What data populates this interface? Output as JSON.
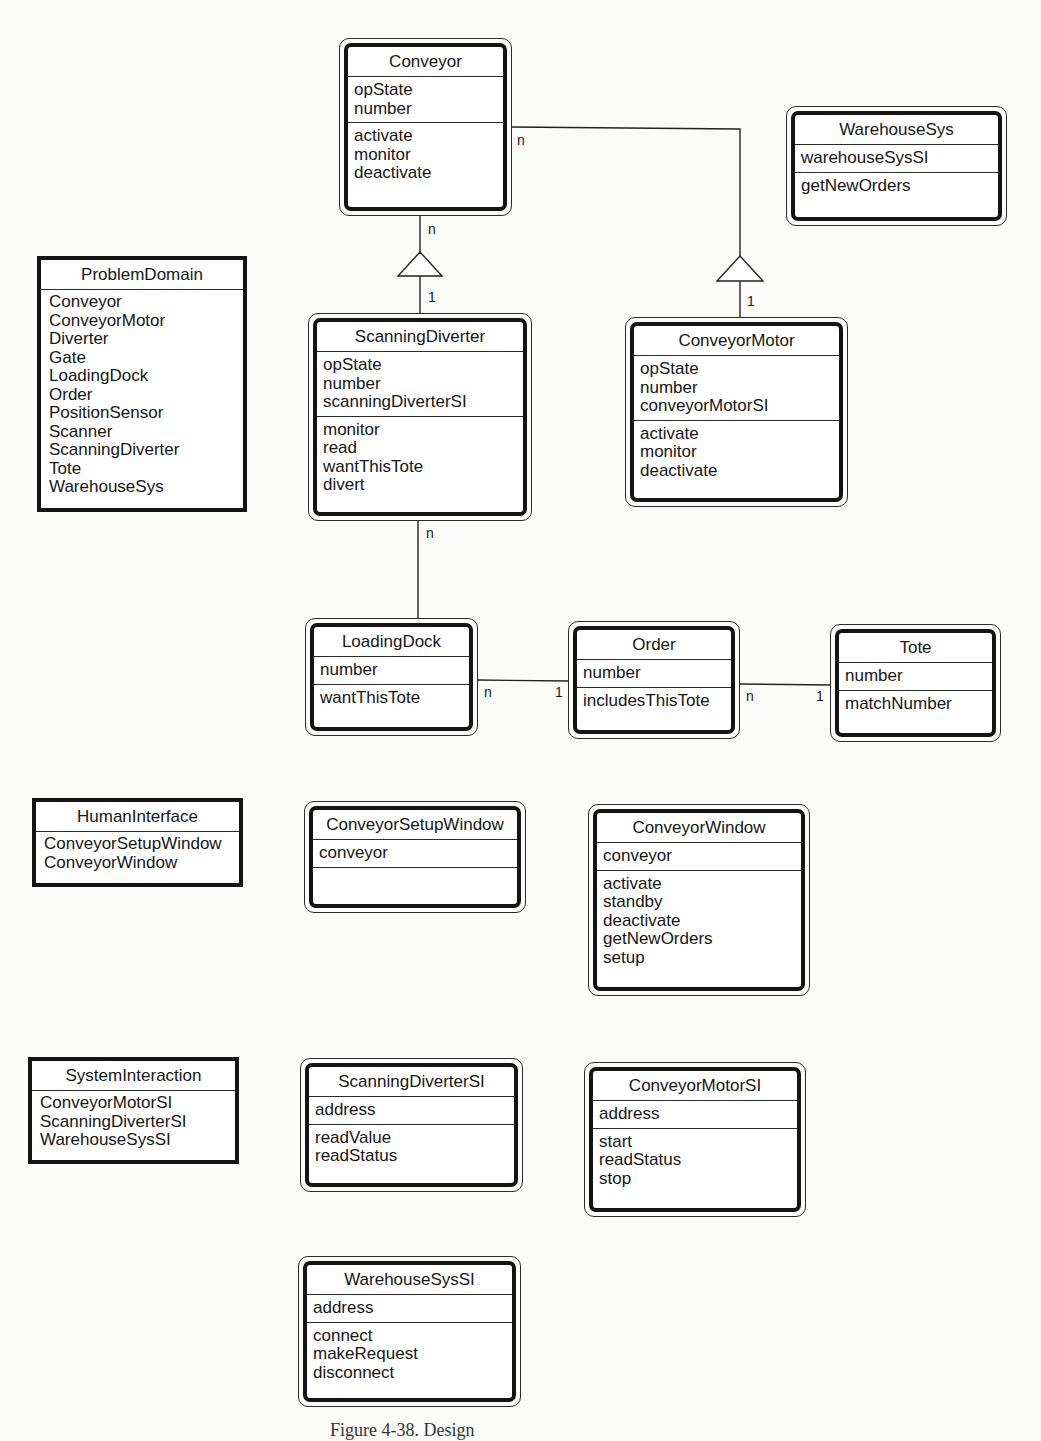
{
  "diagram": {
    "classes": {
      "conveyor": {
        "name": "Conveyor",
        "attributes": [
          "opState",
          "number"
        ],
        "services": [
          "activate",
          "monitor",
          "deactivate"
        ]
      },
      "warehouse_sys": {
        "name": "WarehouseSys",
        "attributes": [
          "warehouseSysSI"
        ],
        "services": [
          "getNewOrders"
        ]
      },
      "scanning_diverter": {
        "name": "ScanningDiverter",
        "attributes": [
          "opState",
          "number",
          "scanningDiverterSI"
        ],
        "services": [
          "monitor",
          "read",
          "wantThisTote",
          "divert"
        ]
      },
      "conveyor_motor": {
        "name": "ConveyorMotor",
        "attributes": [
          "opState",
          "number",
          "conveyorMotorSI"
        ],
        "services": [
          "activate",
          "monitor",
          "deactivate"
        ]
      },
      "loading_dock": {
        "name": "LoadingDock",
        "attributes": [
          "number"
        ],
        "services": [
          "wantThisTote"
        ]
      },
      "order": {
        "name": "Order",
        "attributes": [
          "number"
        ],
        "services": [
          "includesThisTote"
        ]
      },
      "tote": {
        "name": "Tote",
        "attributes": [
          "number"
        ],
        "services": [
          "matchNumber"
        ]
      },
      "conveyor_setup_window": {
        "name": "ConveyorSetupWindow",
        "attributes": [
          "conveyor"
        ],
        "services": []
      },
      "conveyor_window": {
        "name": "ConveyorWindow",
        "attributes": [
          "conveyor"
        ],
        "services": [
          "activate",
          "standby",
          "deactivate",
          "getNewOrders",
          "setup"
        ]
      },
      "scanning_diverter_si": {
        "name": "ScanningDiverterSI",
        "attributes": [
          "address"
        ],
        "services": [
          "readValue",
          "readStatus"
        ]
      },
      "conveyor_motor_si": {
        "name": "ConveyorMotorSI",
        "attributes": [
          "address"
        ],
        "services": [
          "start",
          "readStatus",
          "stop"
        ]
      },
      "warehouse_sys_si": {
        "name": "WarehouseSysSI",
        "attributes": [
          "address"
        ],
        "services": [
          "connect",
          "makeRequest",
          "disconnect"
        ]
      }
    },
    "subjects": {
      "problem_domain": {
        "name": "ProblemDomain",
        "items": [
          "Conveyor",
          "ConveyorMotor",
          "Diverter",
          "Gate",
          "LoadingDock",
          "Order",
          "PositionSensor",
          "Scanner",
          "ScanningDiverter",
          "Tote",
          "WarehouseSys"
        ]
      },
      "human_interface": {
        "name": "HumanInterface",
        "items": [
          "ConveyorSetupWindow",
          "ConveyorWindow"
        ]
      },
      "system_interaction": {
        "name": "SystemInteraction",
        "items": [
          "ConveyorMotorSI",
          "ScanningDiverterSI",
          "WarehouseSysSI"
        ]
      }
    },
    "multiplicities": {
      "conveyor_to_scanning_diverter_whole": "n",
      "conveyor_to_scanning_diverter_part": "1",
      "conveyor_to_motor_whole": "n",
      "conveyor_to_motor_part": "1",
      "scanning_diverter_to_dock": "n",
      "dock_to_order_dock": "n",
      "dock_to_order_order": "1",
      "order_to_tote_order": "n",
      "order_to_tote_tote": "1"
    },
    "caption": "Figure 4-38. Design"
  }
}
